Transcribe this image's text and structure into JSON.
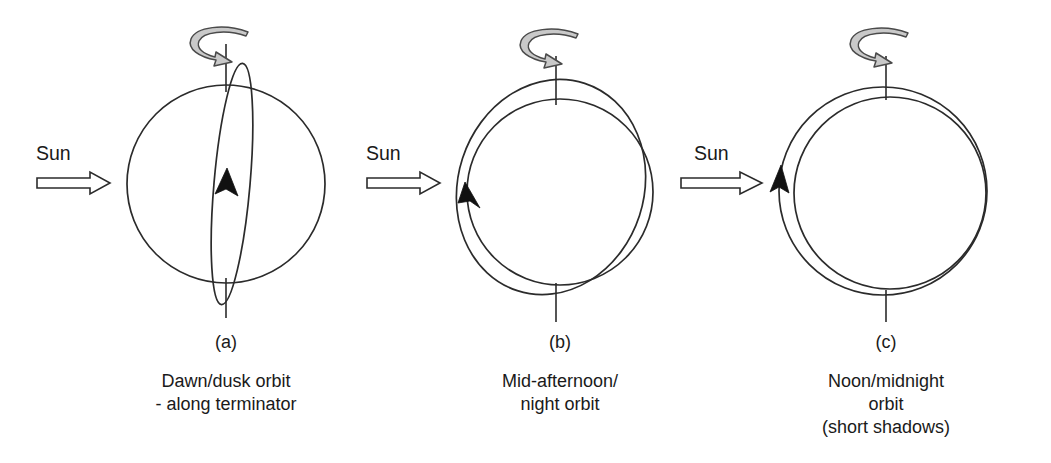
{
  "figure": {
    "background_color": "#ffffff",
    "line_color": "#2b2b2b",
    "spin_arrow_fill": "#c9c9c9",
    "arrowhead_fill": "#111111"
  },
  "panels": [
    {
      "id": "a",
      "letter": "(a)",
      "sun_label": "Sun",
      "caption_lines": [
        "Dawn/dusk orbit",
        "- along terminator"
      ],
      "orbit_type": "edge-on narrow ellipse along terminator",
      "orbit_direction_marker": "upward arrowhead at globe center"
    },
    {
      "id": "b",
      "letter": "(b)",
      "sun_label": "Sun",
      "caption_lines": [
        "Mid-afternoon/",
        "night orbit"
      ],
      "orbit_type": "tilted circular orbit inclined to the globe",
      "orbit_direction_marker": "upward-left arrowhead on left limb"
    },
    {
      "id": "c",
      "letter": "(c)",
      "sun_label": "Sun",
      "caption_lines": [
        "Noon/midnight",
        "orbit",
        "(short shadows)"
      ],
      "orbit_type": "concentric circular orbit facing the Sun",
      "orbit_direction_marker": "upward arrowhead on left limb"
    }
  ],
  "annotations": {
    "rotation_icon_name": "earth-rotation-arrow",
    "sun_icon_name": "sun-direction-arrow"
  }
}
